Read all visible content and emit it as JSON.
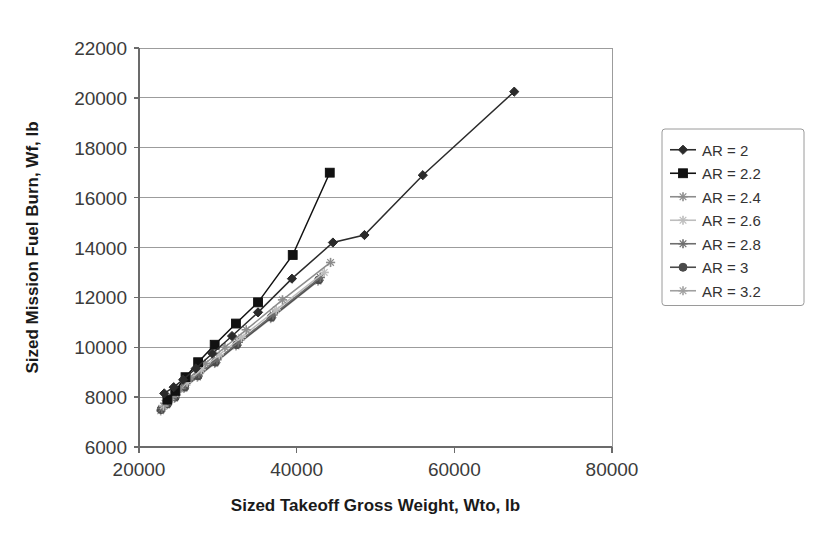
{
  "chart_data": {
    "type": "line",
    "title": "",
    "xlabel": "Sized Takeoff Gross Weight, Wto, lb",
    "ylabel": "Sized Mission Fuel Burn, Wf, lb",
    "xlim": [
      20000,
      80000
    ],
    "ylim": [
      6000,
      22000
    ],
    "xticks": [
      20000,
      40000,
      60000,
      80000
    ],
    "yticks": [
      6000,
      8000,
      10000,
      12000,
      14000,
      16000,
      18000,
      20000,
      22000
    ],
    "xtick_labels": [
      "20000",
      "40000",
      "60000",
      "80000"
    ],
    "ytick_labels": [
      "6000",
      "8000",
      "10000",
      "12000",
      "14000",
      "16000",
      "18000",
      "20000",
      "22000"
    ],
    "grid": "horizontal",
    "legend_position": "right-outside",
    "series": [
      {
        "name": "AR = 2",
        "color": "#2b2b2b",
        "marker": "diamond",
        "x": [
          23200,
          24400,
          25600,
          27200,
          29300,
          31800,
          35100,
          39400,
          44600,
          48600,
          56000,
          67600
        ],
        "y": [
          8150,
          8400,
          8700,
          9150,
          9750,
          10450,
          11400,
          12750,
          14200,
          14500,
          16900,
          20250
        ]
      },
      {
        "name": "AR = 2.2",
        "color": "#111111",
        "marker": "square",
        "x": [
          23600,
          24600,
          25900,
          27500,
          29600,
          32300,
          35100,
          39500,
          44200
        ],
        "y": [
          7900,
          8250,
          8800,
          9400,
          10100,
          10950,
          11800,
          13700,
          17000
        ]
      },
      {
        "name": "AR = 2.4",
        "color": "#8c8c8c",
        "marker": "cross",
        "x": [
          23300,
          24200,
          25200,
          26500,
          28400,
          30900,
          33600,
          38200,
          44300
        ],
        "y": [
          7750,
          8000,
          8350,
          8800,
          9350,
          10000,
          10700,
          11900,
          13400
        ]
      },
      {
        "name": "AR = 2.6",
        "color": "#bdbdbd",
        "marker": "cross",
        "x": [
          23100,
          23900,
          24900,
          26100,
          27900,
          30200,
          33000,
          37400,
          43500
        ],
        "y": [
          7650,
          7900,
          8200,
          8600,
          9100,
          9700,
          10400,
          11500,
          13000
        ]
      },
      {
        "name": "AR = 2.8",
        "color": "#6e6e6e",
        "marker": "cross",
        "x": [
          22900,
          23700,
          24700,
          25900,
          27600,
          29900,
          32600,
          37000,
          43000
        ],
        "y": [
          7550,
          7800,
          8100,
          8500,
          8950,
          9500,
          10200,
          11300,
          12800
        ]
      },
      {
        "name": "AR = 3",
        "color": "#4a4a4a",
        "marker": "circle",
        "x": [
          22800,
          23600,
          24600,
          25800,
          27500,
          29700,
          32400,
          36800,
          42800
        ],
        "y": [
          7500,
          7720,
          8000,
          8400,
          8850,
          9400,
          10100,
          11200,
          12700
        ]
      },
      {
        "name": "AR = 3.2",
        "color": "#a0a0a0",
        "marker": "cross",
        "x": [
          22750,
          23500,
          24500,
          25700,
          27400,
          29600,
          32300,
          36700,
          42700
        ],
        "y": [
          7450,
          7680,
          7950,
          8350,
          8800,
          9350,
          10050,
          11150,
          12650
        ]
      }
    ]
  },
  "legend": {
    "items": [
      {
        "label": "AR =  2",
        "color": "#2b2b2b",
        "marker": "diamond"
      },
      {
        "label": "AR =  2.2",
        "color": "#111111",
        "marker": "square"
      },
      {
        "label": "AR =  2.4",
        "color": "#8c8c8c",
        "marker": "cross"
      },
      {
        "label": "AR =  2.6",
        "color": "#bdbdbd",
        "marker": "cross"
      },
      {
        "label": "AR =  2.8",
        "color": "#6e6e6e",
        "marker": "cross"
      },
      {
        "label": "AR =  3",
        "color": "#4a4a4a",
        "marker": "circle"
      },
      {
        "label": "AR =  3.2",
        "color": "#a0a0a0",
        "marker": "cross"
      }
    ]
  },
  "axes": {
    "x_title": "Sized Takeoff Gross Weight, Wto, lb",
    "y_title": "Sized Mission Fuel Burn, Wf, lb"
  },
  "colors": {
    "gridline": "#9c9c9c",
    "axis": "#6b6b6b",
    "text": "#333333",
    "background": "#ffffff"
  }
}
